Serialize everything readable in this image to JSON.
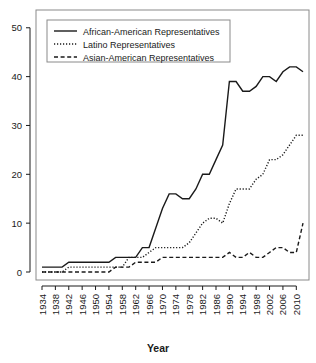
{
  "chart_data": {
    "type": "line",
    "title": "",
    "xlabel": "Year",
    "ylabel": "",
    "xlim": [
      1934,
      2012
    ],
    "ylim": [
      0,
      52
    ],
    "grid": false,
    "legend_position": "top-left",
    "x_tick_labels": [
      "1934",
      "1938",
      "1942",
      "1946",
      "1950",
      "1954",
      "1958",
      "1962",
      "1966",
      "1970",
      "1974",
      "1978",
      "1982",
      "1986",
      "1990",
      "1994",
      "1998",
      "2002",
      "2006",
      "2010"
    ],
    "y_tick_labels": [
      "0",
      "10",
      "20",
      "30",
      "40",
      "50"
    ],
    "y_ticks": [
      0,
      10,
      20,
      30,
      40,
      50
    ],
    "x": [
      1934,
      1936,
      1938,
      1940,
      1942,
      1944,
      1946,
      1948,
      1950,
      1952,
      1954,
      1956,
      1958,
      1960,
      1962,
      1964,
      1966,
      1968,
      1970,
      1972,
      1974,
      1976,
      1978,
      1980,
      1982,
      1984,
      1986,
      1988,
      1990,
      1992,
      1994,
      1996,
      1998,
      2000,
      2002,
      2004,
      2006,
      2008,
      2010,
      2012
    ],
    "series": [
      {
        "name": "African-American Representatives",
        "style": "solid",
        "values": [
          1,
          1,
          1,
          1,
          2,
          2,
          2,
          2,
          2,
          2,
          2,
          3,
          3,
          3,
          3,
          5,
          5,
          9,
          13,
          16,
          16,
          15,
          15,
          17,
          20,
          20,
          23,
          26,
          39,
          39,
          37,
          37,
          38,
          40,
          40,
          39,
          41,
          42,
          42,
          41
        ]
      },
      {
        "name": "Latino Representatives",
        "style": "dotted",
        "values": [
          0,
          0,
          0,
          0,
          1,
          1,
          1,
          1,
          1,
          1,
          1,
          1,
          1,
          3,
          3,
          3,
          4,
          5,
          5,
          5,
          5,
          5,
          6,
          8,
          10,
          11,
          11,
          10,
          14,
          17,
          17,
          17,
          19,
          20,
          23,
          23,
          24,
          26,
          28,
          28
        ]
      },
      {
        "name": "Asian-American Representatives",
        "style": "dashed",
        "values": [
          0,
          0,
          0,
          0,
          0,
          0,
          0,
          0,
          0,
          0,
          0,
          1,
          1,
          1,
          2,
          2,
          2,
          2,
          3,
          3,
          3,
          3,
          3,
          3,
          3,
          3,
          3,
          3,
          4,
          3,
          3,
          4,
          3,
          3,
          4,
          5,
          5,
          4,
          4,
          10
        ]
      }
    ]
  },
  "legend": {
    "entries": [
      {
        "label": "African-American Representatives",
        "style": "solid"
      },
      {
        "label": "Latino Representatives",
        "style": "dotted"
      },
      {
        "label": "Asian-American Representatives",
        "style": "dashed"
      }
    ]
  },
  "axes": {
    "x_title": "Year"
  }
}
